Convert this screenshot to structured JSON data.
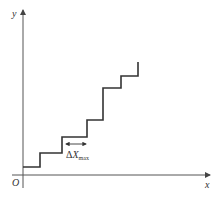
{
  "diagram": {
    "title": "",
    "axes": {
      "x_label": "x",
      "y_label": "y",
      "origin_label": "O"
    },
    "annotation": {
      "delta_symbol": "Δ",
      "variable": "X",
      "subscript": "max"
    },
    "colors": {
      "axis": "#555555",
      "staircase": "#333333",
      "background": "#ffffff"
    },
    "staircase_steps": [
      {
        "x_start": 23,
        "x_end": 40,
        "y": 167
      },
      {
        "x_start": 40,
        "x_end": 62,
        "y": 153
      },
      {
        "x_start": 62,
        "x_end": 87,
        "y": 137
      },
      {
        "x_start": 87,
        "x_end": 103,
        "y": 120
      },
      {
        "x_start": 103,
        "x_end": 121,
        "y": 88
      },
      {
        "x_start": 121,
        "x_end": 138,
        "y": 76
      }
    ]
  }
}
